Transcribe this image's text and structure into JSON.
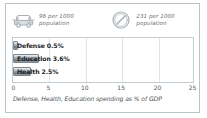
{
  "card": {
    "border_color": "#b9c4c9",
    "background": "#ffffff"
  },
  "stats": [
    {
      "icon": "car-icon",
      "value": "96 per 1000",
      "unit": "population",
      "text": "96 per 1000\npopulation"
    },
    {
      "icon": "telephone-dial-icon",
      "value": "231 per 1000",
      "unit": "population",
      "text": "231 per 1000\npopulation"
    }
  ],
  "chart_data": {
    "type": "bar",
    "orientation": "horizontal",
    "title": "",
    "caption": "Defense, Health, Education spending as % of GDP",
    "categories": [
      "Defense",
      "Education",
      "Health"
    ],
    "values": [
      0.5,
      3.6,
      2.5
    ],
    "data_labels": [
      "Defense 0.5%",
      "Education 3.6%",
      "Health 2.5%"
    ],
    "xlabel": "",
    "ylabel": "",
    "xlim": [
      0,
      25
    ],
    "xticks": [
      0,
      5,
      10,
      15,
      20,
      25
    ],
    "xtick_labels": [
      "0",
      "5",
      "10",
      "15",
      "20",
      "25"
    ],
    "grid": true,
    "legend": "none",
    "bar_color": "#8d969c",
    "grid_color": "#dfe5e8"
  }
}
